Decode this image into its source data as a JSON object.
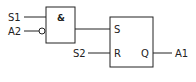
{
  "diagram": {
    "and_gate": {
      "symbol": "&"
    },
    "sr_latch": {
      "set_pin": "S",
      "reset_pin": "R",
      "output_pin": "Q"
    },
    "inputs": {
      "s1": "S1",
      "a2": "A2",
      "s2": "S2"
    },
    "outputs": {
      "a1": "A1"
    },
    "line_color": "#222222"
  }
}
